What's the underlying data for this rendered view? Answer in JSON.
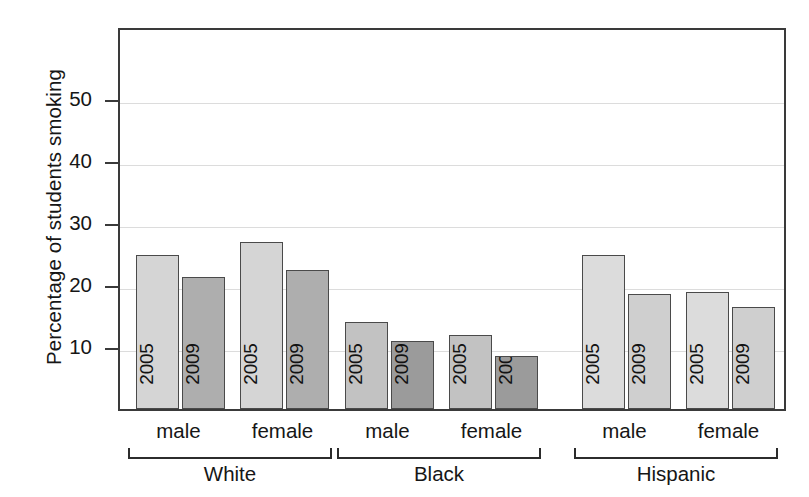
{
  "chart_data": {
    "type": "bar",
    "title": "",
    "xlabel": "",
    "ylabel": "Percentage of students smoking",
    "ylim": [
      0,
      62
    ],
    "yticks": [
      10,
      20,
      30,
      40,
      50
    ],
    "ytick_labels": [
      "10",
      "20",
      "30",
      "40",
      "50"
    ],
    "grid": true,
    "legend": "none",
    "series": [
      {
        "name": "2005",
        "values": [
          24.8,
          27.0,
          14.1,
          11.9,
          24.8,
          18.9
        ]
      },
      {
        "name": "2009",
        "values": [
          21.3,
          22.5,
          11.0,
          8.5,
          18.6,
          16.5
        ]
      }
    ],
    "categories": [
      "White male",
      "White female",
      "Black male",
      "Black female",
      "Hispanic male",
      "Hispanic female"
    ],
    "groups": [
      {
        "label": "White",
        "subgroups": [
          {
            "label": "male",
            "bars": [
              {
                "year": "2005",
                "value": 24.8,
                "color": "#d5d5d5"
              },
              {
                "year": "2009",
                "value": 21.3,
                "color": "#aeaeae"
              }
            ]
          },
          {
            "label": "female",
            "bars": [
              {
                "year": "2005",
                "value": 27.0,
                "color": "#d5d5d5"
              },
              {
                "year": "2009",
                "value": 22.5,
                "color": "#aeaeae"
              }
            ]
          }
        ]
      },
      {
        "label": "Black",
        "subgroups": [
          {
            "label": "male",
            "bars": [
              {
                "year": "2005",
                "value": 14.1,
                "color": "#c2c2c2"
              },
              {
                "year": "2009",
                "value": 11.0,
                "color": "#9b9b9b"
              }
            ]
          },
          {
            "label": "female",
            "bars": [
              {
                "year": "2005",
                "value": 11.9,
                "color": "#c2c2c2"
              },
              {
                "year": "2009",
                "value": 8.5,
                "color": "#9b9b9b"
              }
            ]
          }
        ]
      },
      {
        "label": "Hispanic",
        "subgroups": [
          {
            "label": "male",
            "bars": [
              {
                "year": "2005",
                "value": 24.8,
                "color": "#dcdcdc"
              },
              {
                "year": "2009",
                "value": 18.6,
                "color": "#cfcfcf"
              }
            ]
          },
          {
            "label": "female",
            "bars": [
              {
                "year": "2005",
                "value": 18.9,
                "color": "#dcdcdc"
              },
              {
                "year": "2009",
                "value": 16.5,
                "color": "#cfcfcf"
              }
            ]
          }
        ]
      }
    ]
  },
  "axis": {
    "y_title": "Percentage of students smoking"
  },
  "colors": {
    "frame": "#3a3a3a",
    "grid": "#dcdcdc",
    "bar_edge": "#4a4a4a",
    "text": "#161616"
  }
}
